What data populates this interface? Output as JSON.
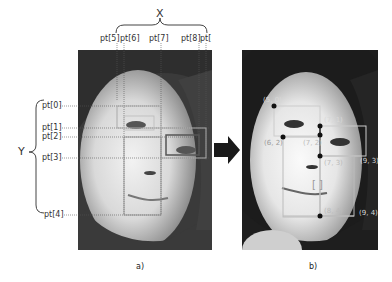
{
  "panel_a": {
    "caption": "a)",
    "x_axis_label": "X",
    "y_axis_label": "Y",
    "x_points": [
      "pt[5]",
      "pt[6]",
      "pt[7]",
      "pt[8]",
      "pt["
    ],
    "y_points": [
      "pt[0]",
      "pt[1]",
      "pt[2]",
      "pt[3]",
      "pt[4]"
    ]
  },
  "panel_b": {
    "caption": "b)",
    "coordinates": [
      "(5, 0)",
      "(7, 1)",
      "(6, 2)",
      "(7, 2)",
      "(7, 3)",
      "(9, 3)",
      "(8, 4)",
      "(9, 4)"
    ],
    "center_mark": "[ ]"
  },
  "arrow": {
    "direction": "right",
    "color": "#1a1a1a"
  }
}
